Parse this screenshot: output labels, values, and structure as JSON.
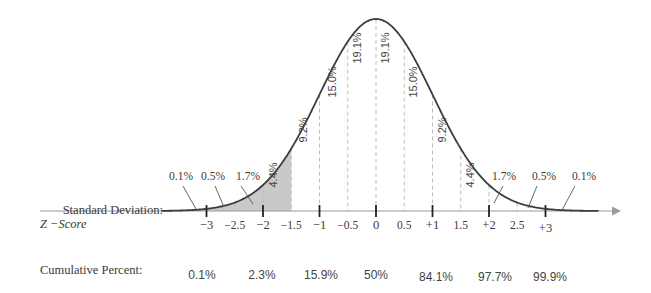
{
  "chart_data": {
    "type": "area",
    "title": "",
    "xlabel": "Z -Score",
    "ylabel": "",
    "row_labels": {
      "standard_deviation": "Standard Deviation:",
      "z_score": "Z −Score",
      "cumulative_percent": "Cumulative Percent:"
    },
    "major_ticks": [
      "−3",
      "−2",
      "−1",
      "0",
      "+1",
      "+2",
      "+3"
    ],
    "tick_labels": [
      {
        "z": -3,
        "label": "−3"
      },
      {
        "z": -2.5,
        "label": "−2.5"
      },
      {
        "z": -2,
        "label": "−2"
      },
      {
        "z": -1.5,
        "label": "−1.5"
      },
      {
        "z": -1,
        "label": "−1"
      },
      {
        "z": -0.5,
        "label": "−0.5"
      },
      {
        "z": 0,
        "label": "0"
      },
      {
        "z": 0.5,
        "label": "0.5"
      },
      {
        "z": 1,
        "label": "+1"
      },
      {
        "z": 1.5,
        "label": "1.5"
      },
      {
        "z": 2,
        "label": "+2"
      },
      {
        "z": 2.5,
        "label": "2.5"
      },
      {
        "z": 3,
        "label": "+3"
      }
    ],
    "band_percentages": [
      {
        "range": "< -3",
        "value": 0.1,
        "label": "0.1%"
      },
      {
        "range": "-3 to -2.5",
        "value": 0.5,
        "label": "0.5%"
      },
      {
        "range": "-2.5 to -2",
        "value": 1.7,
        "label": "1.7%"
      },
      {
        "range": "-2 to -1.5",
        "value": 4.4,
        "label": "4.4%"
      },
      {
        "range": "-1.5 to -1",
        "value": 9.2,
        "label": "9.2%"
      },
      {
        "range": "-1 to -0.5",
        "value": 15.0,
        "label": "15.0%"
      },
      {
        "range": "-0.5 to 0",
        "value": 19.1,
        "label": "19.1%"
      },
      {
        "range": "0 to 0.5",
        "value": 19.1,
        "label": "19.1%"
      },
      {
        "range": "0.5 to 1",
        "value": 15.0,
        "label": "15.0%"
      },
      {
        "range": "1 to 1.5",
        "value": 9.2,
        "label": "9.2%"
      },
      {
        "range": "1.5 to 2",
        "value": 4.4,
        "label": "4.4%"
      },
      {
        "range": "2 to 2.5",
        "value": 1.7,
        "label": "1.7%"
      },
      {
        "range": "2.5 to 3",
        "value": 0.5,
        "label": "0.5%"
      },
      {
        "range": "> 3",
        "value": 0.1,
        "label": "0.1%"
      }
    ],
    "cumulative_percent": [
      {
        "z": -3,
        "value": 0.1,
        "label": "0.1%"
      },
      {
        "z": -2,
        "value": 2.3,
        "label": "2.3%"
      },
      {
        "z": -1,
        "value": 15.9,
        "label": "15.9%"
      },
      {
        "z": 0,
        "value": 50,
        "label": "50%"
      },
      {
        "z": 1,
        "value": 84.1,
        "label": "84.1%"
      },
      {
        "z": 2,
        "value": 97.7,
        "label": "97.7%"
      },
      {
        "z": 3,
        "value": 99.9,
        "label": "99.9%"
      }
    ],
    "shaded_region": {
      "from": "-inf",
      "to": -1.5,
      "color": "#c8c8c8"
    },
    "xlim": [
      -3.8,
      4.3
    ],
    "grid": false,
    "legend": "none"
  },
  "colors": {
    "curve": "#3c3c3c",
    "axis": "#9a9a9a",
    "dashed": "#bdbdbd",
    "shade": "#c9c9c9",
    "text": "#3a3a3a"
  }
}
